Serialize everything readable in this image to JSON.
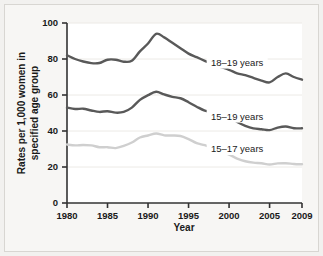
{
  "chart_data": {
    "type": "line",
    "title": "",
    "xlabel": "Year",
    "ylabel": "Rates per 1,000 women in specified age group",
    "xlim": [
      1980,
      2009
    ],
    "ylim": [
      0,
      100
    ],
    "xticks": [
      "1980",
      "1985",
      "1990",
      "1995",
      "2000",
      "2005",
      "2009"
    ],
    "xtick_values": [
      1980,
      1985,
      1990,
      1995,
      2000,
      2005,
      2009
    ],
    "yticks": [
      "0",
      "20",
      "40",
      "60",
      "80",
      "100"
    ],
    "ytick_values": [
      0,
      20,
      40,
      60,
      80,
      100
    ],
    "grid": "horizontal",
    "legend_position": "inline-right",
    "x": [
      1980,
      1981,
      1982,
      1983,
      1984,
      1985,
      1986,
      1987,
      1988,
      1989,
      1990,
      1991,
      1992,
      1993,
      1994,
      1995,
      1996,
      1997,
      1998,
      1999,
      2000,
      2001,
      2002,
      2003,
      2004,
      2005,
      2006,
      2007,
      2008,
      2009
    ],
    "series": [
      {
        "name": "18-19 years",
        "label": "18–19 years",
        "color": "#595959",
        "values": [
          82.1,
          80.0,
          78.6,
          77.7,
          77.8,
          79.6,
          79.6,
          78.5,
          79.0,
          84.2,
          88.6,
          94.0,
          92.0,
          89.0,
          86.0,
          83.0,
          81.0,
          79.0,
          77.0,
          75.5,
          74.0,
          72.0,
          71.0,
          69.5,
          68.0,
          67.0,
          70.0,
          72.0,
          70.0,
          68.5
        ]
      },
      {
        "name": "15-19 years",
        "label": "15–19 years",
        "color": "#595959",
        "values": [
          53.0,
          52.2,
          52.4,
          51.4,
          50.6,
          51.0,
          50.2,
          50.6,
          53.0,
          57.3,
          59.9,
          61.8,
          60.3,
          59.0,
          58.2,
          56.0,
          53.5,
          51.3,
          50.3,
          48.8,
          47.7,
          45.0,
          42.9,
          41.5,
          41.0,
          40.5,
          41.9,
          42.5,
          41.5,
          41.5
        ]
      },
      {
        "name": "15-17 years",
        "label": "15–17 years",
        "color": "#cfcfcf",
        "values": [
          32.5,
          32.0,
          32.2,
          32.0,
          31.0,
          31.0,
          30.5,
          31.7,
          33.6,
          36.4,
          37.5,
          38.6,
          37.6,
          37.5,
          37.2,
          35.5,
          33.3,
          32.1,
          30.4,
          28.2,
          26.9,
          24.7,
          23.2,
          22.4,
          22.1,
          21.4,
          22.0,
          22.1,
          21.7,
          21.5
        ]
      }
    ],
    "annotations": [
      {
        "text": "18–19 years",
        "x": 2001,
        "y": 78
      },
      {
        "text": "15–19 years",
        "x": 2001,
        "y": 48
      },
      {
        "text": "15–17 years",
        "x": 2001,
        "y": 30
      }
    ]
  },
  "colors": {
    "background": "#f7f6f4",
    "plot_background": "#ffffff",
    "axis": "#333333",
    "grid": "#eceae6",
    "dark_series": "#595959",
    "light_series": "#cfcfcf",
    "text": "#1a1a1a"
  }
}
